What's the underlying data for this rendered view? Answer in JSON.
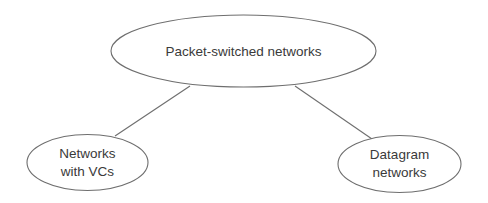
{
  "diagram": {
    "type": "tree",
    "colors": {
      "stroke": "#6e6e6e",
      "text": "#3a3a3a",
      "background": "#ffffff"
    },
    "nodes": [
      {
        "id": "root",
        "lines": [
          "Packet-switched networks"
        ]
      },
      {
        "id": "vc",
        "lines": [
          "Networks",
          "with VCs"
        ]
      },
      {
        "id": "datagram",
        "lines": [
          "Datagram",
          "networks"
        ]
      }
    ],
    "edges": [
      {
        "from": "root",
        "to": "vc"
      },
      {
        "from": "root",
        "to": "datagram"
      }
    ]
  }
}
